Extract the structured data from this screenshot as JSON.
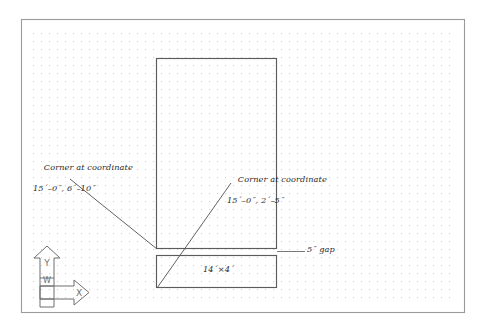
{
  "drawing": {
    "title": "CAD plan drawing with grid and dimension callouts",
    "border_color": "#8a8a8a",
    "grid_dot_color": "#d8d8e0",
    "geometry_color": "#555555",
    "leader_color": "#5a5a5a",
    "text_color": "#2a2a2a",
    "background": "#ffffff"
  },
  "annotations": {
    "corner_upper_left": {
      "line1": "Corner at coordinate",
      "line2": "15´–0˝, 6´–10˝"
    },
    "corner_lower_right": {
      "line1": "Corner at coordinate",
      "line2": "15´–0˝, 2´–5˝"
    },
    "gap_note": "5˝ gap",
    "slab_dimension": "14´×4´"
  },
  "ucs_icon": {
    "y_axis_label": "Y",
    "x_axis_label": "X",
    "world_label": "W"
  },
  "shapes": {
    "tall_rectangle": {
      "x": 156,
      "y": 58,
      "width": 121,
      "height": 191
    },
    "wide_rectangle": {
      "x": 156,
      "y": 255,
      "width": 121,
      "height": 33
    },
    "gap_height": 6,
    "border": {
      "x": 21,
      "y": 19,
      "width": 444,
      "height": 294
    },
    "grid": {
      "x": 33,
      "y": 33,
      "width": 422,
      "height": 272,
      "spacing": 8
    }
  },
  "leaders": {
    "leader_upper_left": {
      "x1": 70,
      "y1": 179,
      "x2": 157,
      "y2": 249
    },
    "leader_lower_right": {
      "x1": 230,
      "y1": 183,
      "x2": 157,
      "y2": 288
    },
    "leader_gap": {
      "x1": 277,
      "y1": 251,
      "x2": 305,
      "y2": 251
    }
  }
}
